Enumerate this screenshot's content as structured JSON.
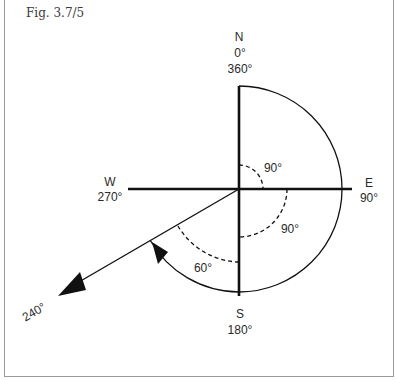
{
  "figure": {
    "label": "Fig. 3.7/5"
  },
  "compass": {
    "north": {
      "letter": "N",
      "deg1": "0°",
      "deg2": "360°"
    },
    "east": {
      "letter": "E",
      "deg": "90°"
    },
    "south": {
      "letter": "S",
      "deg": "180°"
    },
    "west": {
      "letter": "W",
      "deg": "270°"
    }
  },
  "angles": {
    "ne_quadrant": "90°",
    "se_quadrant": "90°",
    "sw_partial": "60°",
    "bearing": "240°"
  },
  "colors": {
    "line": "#111111",
    "text": "#2a2a2a",
    "border": "#9a9a9a"
  }
}
